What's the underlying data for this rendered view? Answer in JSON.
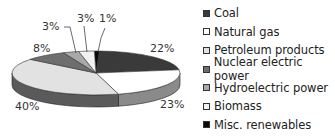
{
  "chart_data": {
    "type": "pie",
    "style": "3d",
    "title": "",
    "categories": [
      "Coal",
      "Natural gas",
      "Petroleum products",
      "Nuclear electric power",
      "Hydroelectric power",
      "Biomass",
      "Misc. renewables"
    ],
    "values": [
      22,
      23,
      40,
      8,
      3,
      3,
      1
    ],
    "value_labels": [
      "22%",
      "23%",
      "40%",
      "8%",
      "3%",
      "3%",
      "1%"
    ],
    "colors": [
      "#3a3a3a",
      "#ffffff",
      "#e2e2e2",
      "#6e6e6e",
      "#a9a9a9",
      "#f2f2f2",
      "#0a0a0a"
    ],
    "legend_position": "right"
  },
  "legend": [
    {
      "label": "Coal",
      "color": "#3a3a3a"
    },
    {
      "label": "Natural gas",
      "color": "#ffffff"
    },
    {
      "label": "Petroleum products",
      "color": "#e2e2e2"
    },
    {
      "label": "Nuclear electric power",
      "color": "#6e6e6e"
    },
    {
      "label": "Hydroelectric power",
      "color": "#a9a9a9"
    },
    {
      "label": "Biomass",
      "color": "#f2f2f2"
    },
    {
      "label": "Misc. renewables",
      "color": "#0a0a0a"
    }
  ],
  "labels": {
    "coal": "22%",
    "natural_gas": "23%",
    "petroleum": "40%",
    "nuclear": "8%",
    "hydro": "3%",
    "biomass": "3%",
    "misc": "1%"
  }
}
